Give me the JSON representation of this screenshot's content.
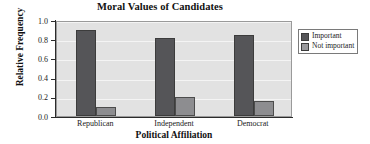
{
  "chart_data": {
    "type": "bar",
    "title": "Moral Values of Candidates",
    "xlabel": "Political Affiliation",
    "ylabel": "Relative Frequency",
    "categories": [
      "Republican",
      "Independent",
      "Democrat"
    ],
    "series": [
      {
        "name": "Important",
        "color": "#555558",
        "values": [
          0.9,
          0.81,
          0.845
        ]
      },
      {
        "name": "Not important",
        "color": "#8d8d90",
        "values": [
          0.09,
          0.2,
          0.16
        ]
      }
    ],
    "ylim": [
      0.0,
      1.0
    ],
    "yticks": [
      "0.0",
      "0.2",
      "0.4",
      "0.6",
      "0.8",
      "1.0"
    ],
    "ytick_values": [
      0.0,
      0.2,
      0.4,
      0.6,
      0.8,
      1.0
    ],
    "grid": true,
    "grid_axis": "y",
    "legend_position": "right",
    "plot_background": "#e2e2e2",
    "grid_color": "#f4f4f4"
  }
}
